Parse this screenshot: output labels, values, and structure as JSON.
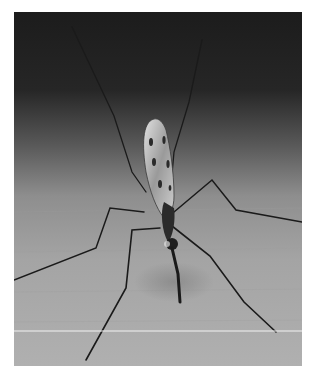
{
  "image": {
    "subject": "mosquito on wooden surface",
    "style": "grayscale photograph",
    "alt": "Close-up grayscale photo of a mosquito with long legs standing on a light wooden surface against a dark background"
  },
  "colors": {
    "border": "#ffffff",
    "background_top": "#1e1e1e",
    "background_mid": "#6a6a6a",
    "surface": "#a9a9a9",
    "insect_dark": "#1a1a1a",
    "wing_light": "#d8d8d8"
  }
}
